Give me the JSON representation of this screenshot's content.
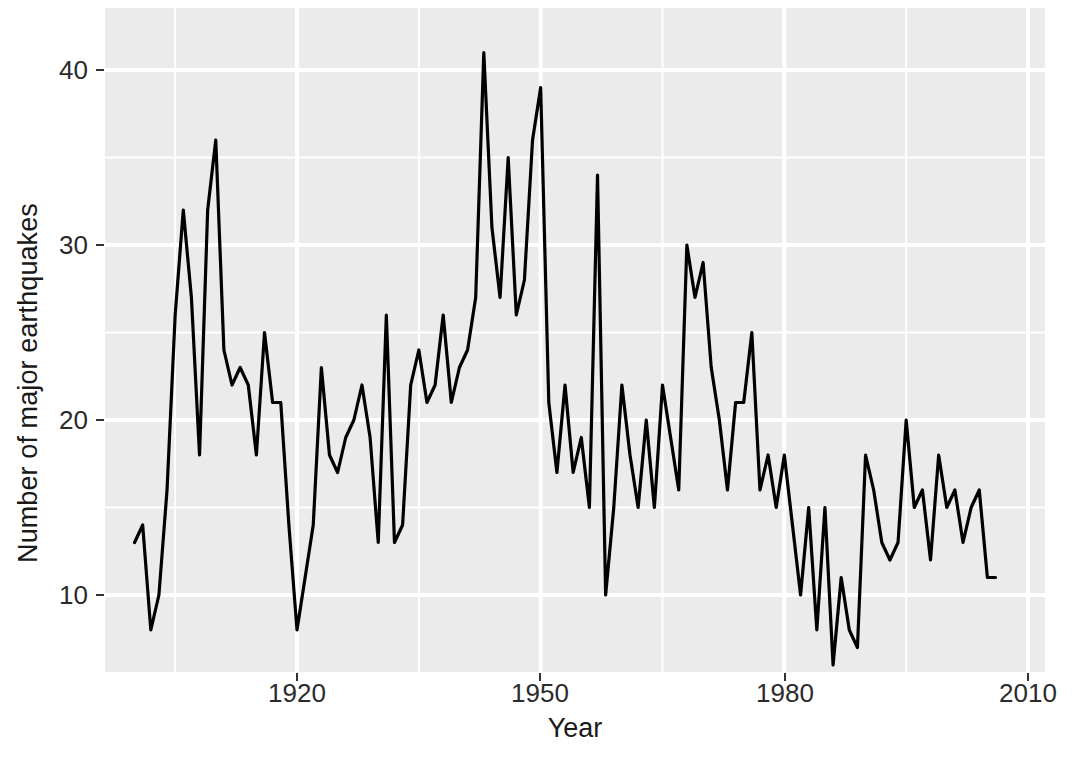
{
  "chart_data": {
    "type": "line",
    "title": "",
    "subtitle": "",
    "xlabel": "Year",
    "ylabel": "Number of major earthquakes",
    "xlim": [
      1896,
      2012
    ],
    "ylim": [
      4.5,
      42.5
    ],
    "xticks": [
      1920,
      1950,
      1980,
      2010
    ],
    "xticklabels": [
      "1920",
      "1950",
      "1980",
      "2010"
    ],
    "yticks": [
      10,
      20,
      30,
      40
    ],
    "yticklabels": [
      "10",
      "20",
      "30",
      "40"
    ],
    "grid": "major-and-minor white gridlines on gray panel",
    "legend": "none",
    "series": [
      {
        "name": "Number of major earthquakes",
        "color": "#000000",
        "x": [
          1900,
          1901,
          1902,
          1903,
          1904,
          1905,
          1906,
          1907,
          1908,
          1909,
          1910,
          1911,
          1912,
          1913,
          1914,
          1915,
          1916,
          1917,
          1918,
          1919,
          1920,
          1921,
          1922,
          1923,
          1924,
          1925,
          1926,
          1927,
          1928,
          1929,
          1930,
          1931,
          1932,
          1933,
          1934,
          1935,
          1936,
          1937,
          1938,
          1939,
          1940,
          1941,
          1942,
          1943,
          1944,
          1945,
          1946,
          1947,
          1948,
          1949,
          1950,
          1951,
          1952,
          1953,
          1954,
          1955,
          1956,
          1957,
          1958,
          1959,
          1960,
          1961,
          1962,
          1963,
          1964,
          1965,
          1966,
          1967,
          1968,
          1969,
          1970,
          1971,
          1972,
          1973,
          1974,
          1975,
          1976,
          1977,
          1978,
          1979,
          1980,
          1981,
          1982,
          1983,
          1984,
          1985,
          1986,
          1987,
          1988,
          1989,
          1990,
          1991,
          1992,
          1993,
          1994,
          1995,
          1996,
          1997,
          1998,
          1999,
          2000,
          2001,
          2002,
          2003,
          2004,
          2005,
          2006
        ],
        "values": [
          13,
          14,
          8,
          10,
          16,
          26,
          32,
          27,
          18,
          32,
          36,
          24,
          22,
          23,
          22,
          18,
          25,
          21,
          21,
          14,
          8,
          11,
          14,
          23,
          18,
          17,
          19,
          20,
          22,
          19,
          13,
          26,
          13,
          14,
          22,
          24,
          21,
          22,
          26,
          21,
          23,
          24,
          27,
          41,
          31,
          27,
          35,
          26,
          28,
          36,
          39,
          21,
          17,
          22,
          17,
          19,
          15,
          34,
          10,
          15,
          22,
          18,
          15,
          20,
          15,
          22,
          19,
          16,
          30,
          27,
          29,
          23,
          20,
          16,
          21,
          21,
          25,
          16,
          18,
          15,
          18,
          14,
          10,
          15,
          8,
          15,
          6,
          11,
          8,
          7,
          18,
          16,
          13,
          12,
          13,
          20,
          15,
          16,
          12,
          18,
          15,
          16,
          13,
          15,
          16,
          11,
          11
        ]
      }
    ]
  },
  "axis": {
    "y_label": "Number of major earthquakes",
    "x_label": "Year",
    "y_tick_labels": [
      "40",
      "30",
      "20",
      "10"
    ],
    "x_tick_labels": [
      "1920",
      "1950",
      "1980",
      "2010"
    ]
  },
  "theme": {
    "panel_fill": "#ebebeb",
    "gridline_major": "#ffffff",
    "gridline_minor": "#ffffff",
    "line_color": "#000000",
    "background": "#ffffff",
    "tick_text_color": "#2b2b2b",
    "axis_title_color": "#1a1a1a"
  }
}
